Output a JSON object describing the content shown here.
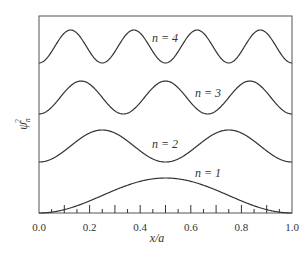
{
  "chart_data": {
    "type": "line",
    "title": "",
    "xlabel": "x/a",
    "ylabel": "ψ_n^2",
    "xlim": [
      0.0,
      1.0
    ],
    "x_ticks": [
      "0.0",
      "0.2",
      "0.4",
      "0.6",
      "0.8",
      "1.0"
    ],
    "grid": false,
    "legend": "inline labels",
    "series": [
      {
        "name": "n = 1",
        "formula": "sin^2(1·πx/a)",
        "peaks_x": [
          0.5
        ],
        "offset_level": 0
      },
      {
        "name": "n = 2",
        "formula": "sin^2(2·πx/a)",
        "peaks_x": [
          0.25,
          0.75
        ],
        "offset_level": 1
      },
      {
        "name": "n = 3",
        "formula": "sin^2(3·πx/a)",
        "peaks_x": [
          0.167,
          0.5,
          0.833
        ],
        "offset_level": 2
      },
      {
        "name": "n = 4",
        "formula": "sin^2(4·πx/a)",
        "peaks_x": [
          0.125,
          0.375,
          0.625,
          0.875
        ],
        "offset_level": 3
      }
    ]
  },
  "labels": {
    "n1": "n = 1",
    "n2": "n = 2",
    "n3": "n = 3",
    "n4": "n = 4",
    "xlabel": "x/a",
    "ylabel_base": "ψ",
    "ylabel_sub": "n",
    "ylabel_sup": "2"
  },
  "ticks": [
    "0.0",
    "0.2",
    "0.4",
    "0.6",
    "0.8",
    "1.0"
  ]
}
